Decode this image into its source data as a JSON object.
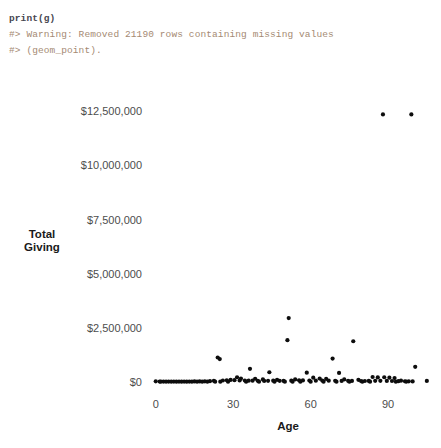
{
  "console": {
    "lines": [
      {
        "name": "code-line",
        "text": "print(g)",
        "style": "code"
      },
      {
        "name": "warning-line-1",
        "text": "#> Warning: Removed 21190 rows containing missing values",
        "style": "warn"
      },
      {
        "name": "warning-line-2",
        "text": "#> (geom_point).",
        "style": "warn"
      }
    ]
  },
  "chart_data": {
    "type": "scatter",
    "title": "",
    "xlabel": "Age",
    "ylabel": "Total\nGiving",
    "xlim": [
      -3,
      107
    ],
    "ylim": [
      0,
      13200000
    ],
    "xticks": [
      0,
      30,
      60,
      90
    ],
    "xticklabels": [
      "0",
      "30",
      "60",
      "90"
    ],
    "yticks": [
      0,
      2500000,
      5000000,
      7500000,
      10000000,
      12500000
    ],
    "yticklabels": [
      "$0",
      "$2,500,000",
      "$5,000,000",
      "$7,500,000",
      "$10,000,000",
      "$12,500,000"
    ],
    "grid": false,
    "legend": false,
    "point_color": "#0d0d0d",
    "points": [
      [
        88.0,
        12350000
      ],
      [
        99.0,
        12350000
      ],
      [
        51.5,
        2950000
      ],
      [
        51.0,
        1930000
      ],
      [
        76.5,
        1880000
      ],
      [
        24.0,
        1130000
      ],
      [
        24.8,
        1060000
      ],
      [
        68.5,
        1080000
      ],
      [
        36.5,
        610000
      ],
      [
        44.0,
        450000
      ],
      [
        58.5,
        430000
      ],
      [
        71.0,
        420000
      ],
      [
        31.5,
        220000
      ],
      [
        33.0,
        160000
      ],
      [
        38.5,
        150000
      ],
      [
        41.5,
        120000
      ],
      [
        47.0,
        100000
      ],
      [
        54.0,
        120000
      ],
      [
        61.0,
        200000
      ],
      [
        63.5,
        160000
      ],
      [
        66.0,
        140000
      ],
      [
        73.0,
        120000
      ],
      [
        78.5,
        100000
      ],
      [
        84.0,
        230000
      ],
      [
        86.0,
        210000
      ],
      [
        88.5,
        220000
      ],
      [
        90.5,
        200000
      ],
      [
        92.5,
        180000
      ],
      [
        95.0,
        60000
      ],
      [
        100.5,
        700000
      ],
      [
        105.0,
        50000
      ],
      [
        0.0,
        30000
      ],
      [
        1.5,
        20000
      ],
      [
        3.0,
        20000
      ],
      [
        5.0,
        20000
      ],
      [
        7.0,
        20000
      ],
      [
        9.0,
        20000
      ],
      [
        11.0,
        20000
      ],
      [
        13.0,
        20000
      ],
      [
        15.0,
        25000
      ],
      [
        17.0,
        25000
      ],
      [
        19.0,
        30000
      ],
      [
        21.0,
        40000
      ],
      [
        22.5,
        55000
      ],
      [
        26.0,
        70000
      ],
      [
        27.5,
        80000
      ],
      [
        29.0,
        95000
      ],
      [
        30.5,
        85000
      ],
      [
        32.5,
        75000
      ],
      [
        34.5,
        70000
      ],
      [
        36.0,
        60000
      ],
      [
        37.5,
        60000
      ],
      [
        39.5,
        55000
      ],
      [
        42.0,
        50000
      ],
      [
        43.5,
        55000
      ],
      [
        45.5,
        60000
      ],
      [
        48.0,
        55000
      ],
      [
        49.5,
        50000
      ],
      [
        52.5,
        60000
      ],
      [
        55.5,
        80000
      ],
      [
        57.0,
        75000
      ],
      [
        59.5,
        70000
      ],
      [
        62.0,
        60000
      ],
      [
        64.5,
        65000
      ],
      [
        67.0,
        60000
      ],
      [
        69.5,
        55000
      ],
      [
        72.0,
        50000
      ],
      [
        74.5,
        55000
      ],
      [
        76.0,
        50000
      ],
      [
        79.5,
        45000
      ],
      [
        81.0,
        45000
      ],
      [
        82.5,
        50000
      ],
      [
        85.0,
        55000
      ],
      [
        87.0,
        55000
      ],
      [
        89.5,
        50000
      ],
      [
        91.5,
        45000
      ],
      [
        94.0,
        40000
      ],
      [
        96.5,
        35000
      ],
      [
        98.0,
        30000
      ],
      [
        99.5,
        25000
      ],
      [
        2.0,
        15000
      ],
      [
        4.0,
        15000
      ],
      [
        6.0,
        15000
      ],
      [
        8.0,
        15000
      ],
      [
        10.0,
        15000
      ],
      [
        12.0,
        15000
      ],
      [
        14.0,
        15000
      ],
      [
        16.0,
        15000
      ],
      [
        18.0,
        15000
      ],
      [
        20.0,
        15000
      ],
      [
        23.0,
        15000
      ],
      [
        25.0,
        15000
      ],
      [
        28.0,
        15000
      ],
      [
        35.0,
        15000
      ],
      [
        40.0,
        15000
      ],
      [
        46.0,
        15000
      ],
      [
        50.0,
        15000
      ],
      [
        53.0,
        15000
      ],
      [
        56.0,
        15000
      ],
      [
        60.0,
        15000
      ],
      [
        65.0,
        15000
      ],
      [
        70.0,
        15000
      ],
      [
        75.0,
        15000
      ],
      [
        80.0,
        15000
      ],
      [
        83.0,
        15000
      ],
      [
        93.0,
        15000
      ],
      [
        97.0,
        15000
      ]
    ]
  }
}
